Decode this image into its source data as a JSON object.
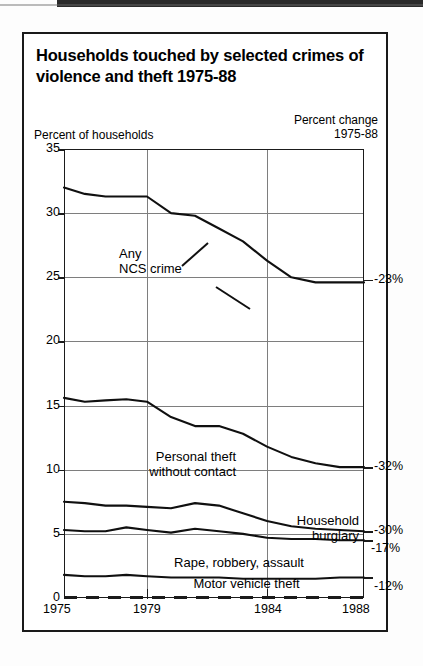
{
  "figure": {
    "title": "Households touched by selected crimes of violence and theft 1975-88",
    "left_axis_title": "Percent of households",
    "right_axis_title_line1": "Percent change",
    "right_axis_title_line2": "1975-88"
  },
  "chart_data": {
    "type": "line",
    "title": "Households touched by selected crimes of violence and theft 1975-88",
    "xlabel": "",
    "ylabel": "Percent of households",
    "xlim": [
      1975,
      1988
    ],
    "ylim": [
      0,
      35
    ],
    "ytick_labels": [
      "0",
      "5",
      "10",
      "15",
      "20",
      "25",
      "30",
      "35"
    ],
    "yticks": [
      0,
      5,
      10,
      15,
      20,
      25,
      30,
      35
    ],
    "xtick_labels": [
      "1975",
      "1979",
      "1984",
      "1988"
    ],
    "xticks": [
      1975,
      1979,
      1984,
      1988
    ],
    "grid": true,
    "legend": "inline-annotations",
    "x": [
      1975,
      1976,
      1977,
      1978,
      1979,
      1980,
      1981,
      1982,
      1983,
      1984,
      1985,
      1986,
      1987,
      1988
    ],
    "series": [
      {
        "name": "Any NCS crime",
        "percent_change_1975_88": "-23%",
        "values": [
          32.0,
          31.5,
          31.3,
          31.3,
          31.3,
          30.0,
          29.8,
          28.8,
          27.8,
          26.3,
          25.0,
          24.6,
          24.6,
          24.6
        ]
      },
      {
        "name": "Personal theft without contact",
        "percent_change_1975_88": "-32%",
        "values": [
          15.6,
          15.3,
          15.4,
          15.5,
          15.3,
          14.1,
          13.4,
          13.4,
          12.8,
          11.8,
          11.0,
          10.5,
          10.2,
          10.2
        ]
      },
      {
        "name": "Household burglary",
        "percent_change_1975_88": "-30%",
        "values": [
          7.5,
          7.4,
          7.2,
          7.2,
          7.1,
          7.0,
          7.4,
          7.2,
          6.6,
          6.0,
          5.6,
          5.4,
          5.3,
          5.2
        ]
      },
      {
        "name": "Rape, robbery, assault",
        "percent_change_1975_88": "-17%",
        "values": [
          5.3,
          5.2,
          5.2,
          5.5,
          5.3,
          5.1,
          5.4,
          5.2,
          5.0,
          4.7,
          4.6,
          4.6,
          4.5,
          4.5
        ]
      },
      {
        "name": "Motor vehicle theft",
        "percent_change_1975_88": "-12%",
        "values": [
          1.8,
          1.7,
          1.7,
          1.8,
          1.7,
          1.6,
          1.6,
          1.6,
          1.5,
          1.5,
          1.5,
          1.5,
          1.6,
          1.6
        ]
      }
    ]
  },
  "labels": {
    "any_ncs_line1": "Any",
    "any_ncs_line2": "NCS crime",
    "personal_theft_line1": "Personal theft",
    "personal_theft_line2": "without contact",
    "household_line1": "Household",
    "household_line2": "burglary",
    "rape_robbery": "Rape, robbery, assault",
    "motor_vehicle": "Motor vehicle theft"
  },
  "percent_changes": {
    "any_ncs": "-23%",
    "personal_theft": "-32%",
    "household_burglary": "-30%",
    "rape_robbery_assault": "-17%",
    "motor_vehicle_theft": "-12%"
  },
  "ytick_labels": [
    "35",
    "30",
    "25",
    "20",
    "15",
    "10",
    "5",
    "0"
  ],
  "xtick_labels": [
    "1975",
    "1979",
    "1984",
    "1988"
  ]
}
